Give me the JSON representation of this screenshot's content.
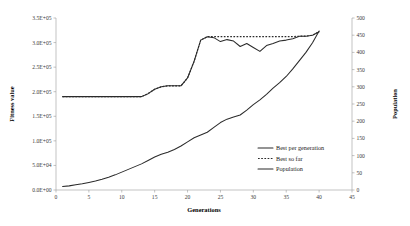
{
  "chart_data": {
    "type": "line",
    "title": "",
    "xlabel": "Generations",
    "ylabel": "Fitness value",
    "y2label": "Population",
    "xlim": [
      0,
      45
    ],
    "ylim": [
      0,
      350000
    ],
    "y2lim": [
      0,
      500
    ],
    "grid": false,
    "legend_position": "inside-right",
    "x_ticks": [
      "0",
      "5",
      "10",
      "15",
      "20",
      "25",
      "30",
      "35",
      "40",
      "45"
    ],
    "x_tick_values": [
      0,
      5,
      10,
      15,
      20,
      25,
      30,
      35,
      40,
      45
    ],
    "y_ticks": [
      "0.0E+00",
      "5.0E+04",
      "1.0E+05",
      "1.5E+05",
      "2.0E+05",
      "2.5E+05",
      "3.0E+05",
      "3.5E+05"
    ],
    "y_tick_values": [
      0,
      50000,
      100000,
      150000,
      200000,
      250000,
      300000,
      350000
    ],
    "y2_ticks": [
      "0",
      "50",
      "100",
      "150",
      "200",
      "250",
      "300",
      "350",
      "400",
      "450",
      "500"
    ],
    "y2_tick_values": [
      0,
      50,
      100,
      150,
      200,
      250,
      300,
      350,
      400,
      450,
      500
    ],
    "x": [
      1,
      2,
      3,
      4,
      5,
      6,
      7,
      8,
      9,
      10,
      11,
      12,
      13,
      14,
      15,
      16,
      17,
      18,
      19,
      20,
      21,
      22,
      23,
      24,
      25,
      26,
      27,
      28,
      29,
      30,
      31,
      32,
      33,
      34,
      35,
      36,
      37,
      38,
      39,
      40
    ],
    "series": [
      {
        "name": "Best per generation",
        "style": "solid",
        "axis": "left",
        "values": [
          190000,
          190000,
          190000,
          190000,
          190000,
          190000,
          190000,
          190000,
          190000,
          190000,
          190000,
          190000,
          190000,
          196000,
          205000,
          210000,
          212000,
          212000,
          212000,
          228000,
          262000,
          305000,
          312000,
          310000,
          302000,
          306000,
          303000,
          292000,
          298000,
          290000,
          282000,
          294000,
          298000,
          303000,
          305000,
          308000,
          313000,
          313000,
          315000,
          322000
        ]
      },
      {
        "name": "Best so far",
        "style": "dotted",
        "axis": "left",
        "values": [
          190000,
          190000,
          190000,
          190000,
          190000,
          190000,
          190000,
          190000,
          190000,
          190000,
          190000,
          190000,
          190000,
          196000,
          205000,
          210000,
          212000,
          212000,
          212000,
          228000,
          262000,
          305000,
          312000,
          312000,
          312000,
          312000,
          312000,
          312000,
          312000,
          312000,
          312000,
          312000,
          312000,
          312000,
          312000,
          312000,
          313000,
          313000,
          315000,
          322000
        ]
      },
      {
        "name": "Population",
        "style": "solid",
        "axis": "right",
        "values": [
          10,
          12,
          15,
          18,
          22,
          26,
          31,
          37,
          44,
          52,
          60,
          68,
          76,
          86,
          96,
          104,
          110,
          118,
          128,
          140,
          152,
          160,
          168,
          182,
          196,
          206,
          212,
          218,
          232,
          248,
          262,
          278,
          296,
          312,
          330,
          352,
          376,
          400,
          428,
          462
        ]
      }
    ]
  },
  "legend": {
    "items": [
      {
        "label": "Best per generation",
        "style": "solid"
      },
      {
        "label": "Best so far",
        "style": "dotted"
      },
      {
        "label": "Population",
        "style": "solid"
      }
    ]
  }
}
